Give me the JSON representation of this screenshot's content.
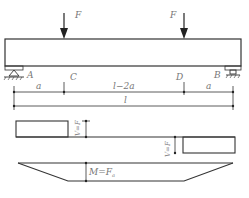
{
  "diagram": {
    "type": "simply-supported beam with two symmetric point loads",
    "loads": [
      {
        "label": "F",
        "position": "C"
      },
      {
        "label": "F",
        "position": "D"
      }
    ],
    "points": [
      "A",
      "C",
      "D",
      "B"
    ],
    "dimensions": {
      "segment_AC": "a",
      "segment_CD": "l−2a",
      "segment_DB": "a",
      "total": "l"
    },
    "shear_diagram": {
      "left_label": "V=F",
      "right_label": "V=F"
    },
    "moment_diagram": {
      "label": "M=F",
      "label_sub": "a"
    }
  }
}
